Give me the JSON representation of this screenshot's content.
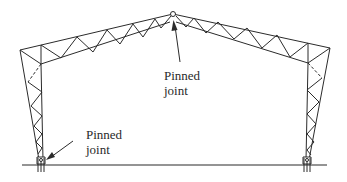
{
  "diagram": {
    "type": "portal-frame-truss",
    "stroke_color": "#2b2b2b",
    "labels": {
      "apex": {
        "line1": "Pinned",
        "line2": "joint"
      },
      "base": {
        "line1": "Pinned",
        "line2": "joint"
      }
    },
    "geometry": {
      "apex": [
        173,
        14
      ],
      "left_eave_outer": [
        20,
        50
      ],
      "left_eave_inner": [
        41,
        64
      ],
      "right_eave_outer": [
        330,
        48
      ],
      "right_eave_inner": [
        308,
        63
      ],
      "left_base": [
        41,
        162
      ],
      "right_base": [
        307,
        162
      ],
      "ground_y": 165,
      "ground_x": [
        22,
        327
      ]
    }
  }
}
